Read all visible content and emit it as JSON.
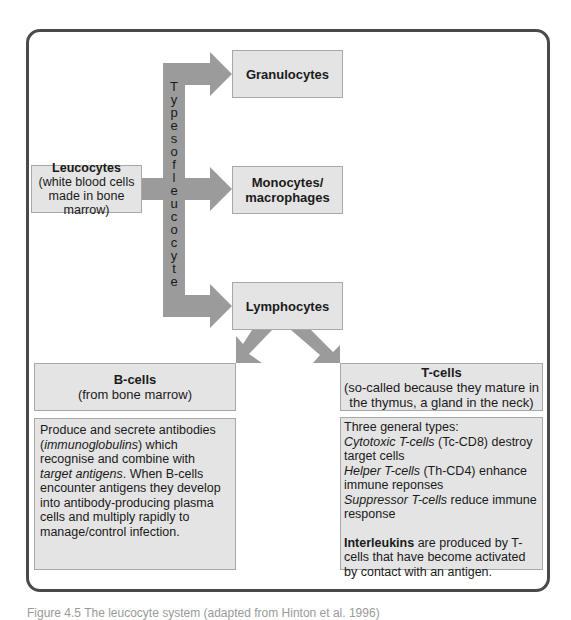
{
  "diagram": {
    "colors": {
      "box_fill": "#e4e4e4",
      "box_border": "#a8a8a8",
      "arrow_fill": "#9b9b9b",
      "frame_border": "#4a4a4a"
    },
    "arrow_label": "Types of leucocyte",
    "arrow_label_letters": [
      "T",
      "y",
      "p",
      "e",
      "s",
      "o",
      "f",
      "l",
      "e",
      "u",
      "c",
      "o",
      "c",
      "y",
      "t",
      "e"
    ],
    "leucocytes": {
      "title": "Leucocytes",
      "subtitle": "(white blood cells made in bone marrow)"
    },
    "granulocytes": {
      "title": "Granulocytes"
    },
    "monocytes": {
      "title_line1": "Monocytes/",
      "title_line2": "macrophages"
    },
    "lymphocytes": {
      "title": "Lymphocytes"
    },
    "b_cells": {
      "title": "B-cells",
      "subtitle": "(from bone marrow)",
      "body": {
        "t1": "Produce and secrete antibodies (",
        "t2_italic": "immunoglobulins",
        "t3": ") which recognise and combine with ",
        "t4_italic": "target antigens",
        "t5": ". When B-cells encounter antigens they develop into antibody-producing plasma cells and multiply rapidly to manage/control infection."
      }
    },
    "t_cells": {
      "title": "T-cells",
      "subtitle": "(so-called because they mature in the thymus, a gland in the neck)",
      "body": {
        "intro": "Three general types:",
        "types": [
          {
            "name": "Cytotoxic T-cells",
            "desc": " (Tc-CD8) destroy target cells"
          },
          {
            "name": "Helper T-cells",
            "desc": " (Th-CD4) enhance immune reponses"
          },
          {
            "name": "Suppressor T-cells",
            "desc": " reduce immune response"
          }
        ],
        "interleukins_bold": "Interleukins",
        "interleukins_rest": " are produced by T-cells that have become activated by contact with an antigen."
      }
    },
    "caption": "Figure 4.5  The leucocyte system (adapted from Hinton et al. 1996)"
  }
}
